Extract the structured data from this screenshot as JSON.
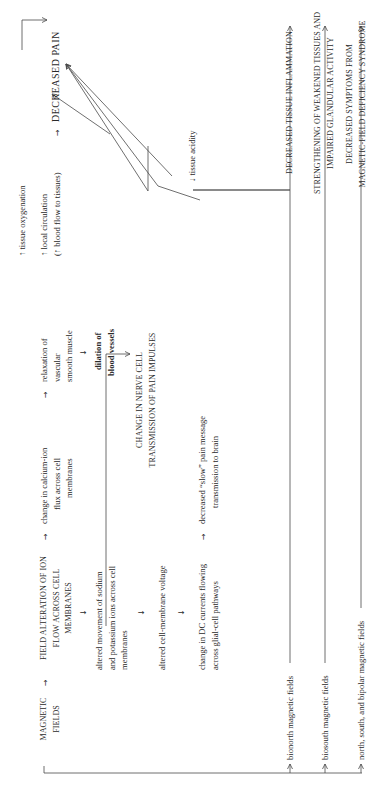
{
  "diagram": {
    "orientation": "rotated 90 degrees counter-clockwise",
    "source": {
      "label_line1": "MAGNETIC",
      "label_line2": "FIELDS"
    },
    "field_alteration": {
      "line1": "FIELD ALTERATION OF ION",
      "line2": "FLOW ACROSS CELL",
      "line3": "MEMBRANES"
    },
    "sodium_potassium": {
      "line1": "altered movement of sodium",
      "line2": "and potassium ions across cell",
      "line3": "membranes"
    },
    "membrane_voltage": {
      "line1": "altered cell-membrane voltage"
    },
    "dc_currents": {
      "line1": "change in DC currents flowing",
      "line2": "across glial-cell pathways"
    },
    "calcium_flux": {
      "line1": "change in calcium-ion",
      "line2": "flux across cell",
      "line3": "membranes"
    },
    "nerve_cell": {
      "line1": "CHANGE IN NERVE CELL",
      "line2": "TRANSMISSION OF PAIN IMPULSES"
    },
    "slow_pain": {
      "line1": "decreased “slow” pain message",
      "line2": "transmission to brain"
    },
    "smooth_muscle": {
      "line1": "relaxation of",
      "line2": "vascular",
      "line3": "smooth muscle"
    },
    "dilation": {
      "line1": "dilation of",
      "line2": "blood vessels"
    },
    "oxygenation": {
      "line1": "↑ tissue oxygenation"
    },
    "circulation": {
      "line1": "↑ local circulation",
      "line2": "(↑ blood flow to tissues)"
    },
    "acidity": {
      "line1": "↓ tissue acidity"
    },
    "outcome": {
      "label": "DECREASED PAIN"
    },
    "field_types": [
      {
        "label": "bionorth magnetic fields",
        "result": "DECREASED TISSUE INFLAMMATION"
      },
      {
        "label": "biosouth magnetic fields",
        "result_line1": "STRENGTHENING OF WEAKENED TISSUES AND",
        "result_line2": "IMPAIRED GLANDULAR ACTIVITY"
      },
      {
        "label": "north, south, and bipolar magnetic fields",
        "result_line1": "DECREASED SYMPTOMS FROM",
        "result_line2": "MAGNETIC-FIELD DEFICIENCY SYNDROME"
      }
    ],
    "arrow_glyphs": {
      "right": "→",
      "down": "↓"
    },
    "colors": {
      "ink": "#2a2a2a",
      "line": "#4a4a4a",
      "background": "#ffffff"
    }
  }
}
